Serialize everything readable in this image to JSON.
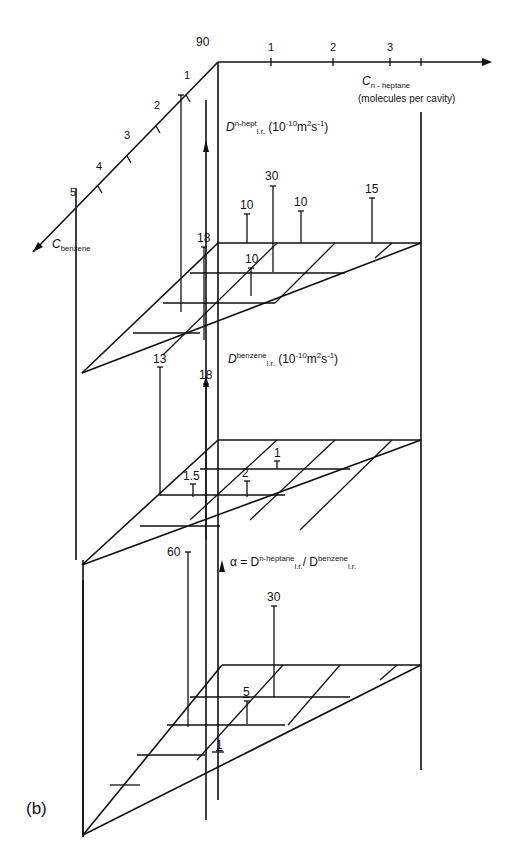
{
  "figure": {
    "panel_label": "(b)",
    "axes": {
      "benzene_axis": {
        "label_main": "C",
        "label_sub": "benzene",
        "ticks": [
          "1",
          "2",
          "3",
          "4",
          "5"
        ]
      },
      "heptane_axis": {
        "label_main": "C",
        "label_sub": "n - heptane",
        "units": "(molecules per cavity)",
        "ticks": [
          "1",
          "2",
          "3"
        ]
      }
    },
    "planes": {
      "upper": {
        "quantity_symbol": "D",
        "superscript": "n-hept",
        "subscript": "l.r.",
        "units": "(10",
        "units_exp": "-10",
        "units_rest": "m",
        "units_exp2": "2",
        "units_tail": "s",
        "units_exp3": "-1",
        "units_close": ")",
        "values": [
          "90",
          "10",
          "30",
          "10",
          "15",
          "18",
          "10"
        ]
      },
      "middle": {
        "quantity_symbol": "D",
        "superscript": "benzene",
        "subscript": "l.r.",
        "units": "(10",
        "units_exp": "-10",
        "units_rest": "m",
        "units_exp2": "2",
        "units_tail": "s",
        "units_exp3": "-1",
        "units_close": ")",
        "values": [
          "13",
          "18",
          "1",
          "1.5",
          "2"
        ]
      },
      "lower": {
        "formula_prefix": "α = D",
        "formula_sup1": "n-heptane",
        "formula_sub1": "l.r.",
        "formula_slash": "/ D",
        "formula_sup2": "benzene",
        "formula_sub2": "l.r.",
        "values": [
          "60",
          "30",
          "5",
          "1"
        ]
      }
    }
  }
}
